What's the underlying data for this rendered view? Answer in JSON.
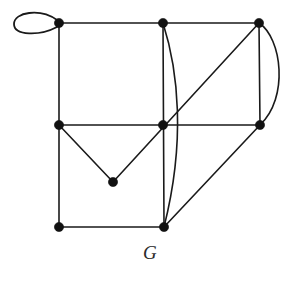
{
  "figure": {
    "label": "G",
    "caption_position": "bottom-center",
    "background_color": "#ffffff",
    "stroke_color": "#1a1a1a",
    "vertex_color": "#111111",
    "width": 300,
    "height": 283
  },
  "graph_data": {
    "type": "diagram",
    "diagram_kind": "undirected-multigraph",
    "title": "G",
    "vertex_count": 9,
    "edge_count": 15,
    "vertices": [
      {
        "id": "v1",
        "name": "top-left-vertex",
        "x": 59,
        "y": 23,
        "radius": 4.6
      },
      {
        "id": "v2",
        "name": "top-middle-vertex",
        "x": 163,
        "y": 23,
        "radius": 4.6
      },
      {
        "id": "v3",
        "name": "top-right-vertex",
        "x": 259,
        "y": 23,
        "radius": 4.6
      },
      {
        "id": "v4",
        "name": "middle-left-vertex",
        "x": 59,
        "y": 125,
        "radius": 4.6
      },
      {
        "id": "v5",
        "name": "center-vertex",
        "x": 163,
        "y": 125,
        "radius": 4.6
      },
      {
        "id": "v6",
        "name": "middle-right-vertex",
        "x": 260,
        "y": 125,
        "radius": 4.6
      },
      {
        "id": "v7",
        "name": "lower-apex-vertex",
        "x": 113,
        "y": 182,
        "radius": 4.6
      },
      {
        "id": "v8",
        "name": "bottom-left-vertex",
        "x": 59,
        "y": 227,
        "radius": 4.6
      },
      {
        "id": "v9",
        "name": "bottom-middle-vertex",
        "x": 164,
        "y": 227,
        "radius": 4.6
      }
    ],
    "edges": [
      {
        "id": "e1",
        "name": "self-loop-top-left",
        "from": "v1",
        "to": "v1",
        "shape": "loop",
        "path": "M 57 20 C 40 8 14 12 14 24 C 14 36 40 36 57 27 Z"
      },
      {
        "id": "e2",
        "name": "edge-top-left-to-top-middle",
        "from": "v1",
        "to": "v2",
        "shape": "line",
        "path": "M 59 23 L 163 23"
      },
      {
        "id": "e3",
        "name": "edge-top-middle-to-top-right",
        "from": "v2",
        "to": "v3",
        "shape": "line",
        "path": "M 163 23 L 259 23"
      },
      {
        "id": "e4",
        "name": "edge-top-left-to-middle-left",
        "from": "v1",
        "to": "v4",
        "shape": "line",
        "path": "M 59 23 L 59 125"
      },
      {
        "id": "e5",
        "name": "edge-top-middle-to-bottom-middle-straight",
        "from": "v2",
        "to": "v9",
        "shape": "line",
        "path": "M 163 23 L 164 227"
      },
      {
        "id": "e6",
        "name": "edge-top-middle-to-bottom-middle-curved",
        "from": "v2",
        "to": "v9",
        "shape": "curve",
        "path": "M 163 23 C 178 70 186 140 164 227"
      },
      {
        "id": "e7",
        "name": "edge-top-right-to-middle-right-straight",
        "from": "v3",
        "to": "v6",
        "shape": "line",
        "path": "M 259 23 L 260 125"
      },
      {
        "id": "e8",
        "name": "edge-top-right-to-middle-right-curved",
        "from": "v3",
        "to": "v6",
        "shape": "curve",
        "path": "M 259 23 C 282 38 289 98 260 125"
      },
      {
        "id": "e9",
        "name": "edge-middle-left-to-center",
        "from": "v4",
        "to": "v5",
        "shape": "line",
        "path": "M 59 125 L 163 125"
      },
      {
        "id": "e10",
        "name": "edge-center-to-middle-right",
        "from": "v5",
        "to": "v6",
        "shape": "line",
        "path": "M 163 125 L 260 125"
      },
      {
        "id": "e11",
        "name": "edge-top-right-to-lower-apex-diagonal",
        "from": "v3",
        "to": "v7",
        "shape": "line",
        "path": "M 259 23 L 113 182"
      },
      {
        "id": "e12",
        "name": "edge-middle-left-to-lower-apex",
        "from": "v4",
        "to": "v7",
        "shape": "line",
        "path": "M 59 125 L 113 182"
      },
      {
        "id": "e13",
        "name": "edge-middle-left-to-bottom-left",
        "from": "v4",
        "to": "v8",
        "shape": "line",
        "path": "M 59 125 L 59 227"
      },
      {
        "id": "e14",
        "name": "edge-bottom-left-to-bottom-middle",
        "from": "v8",
        "to": "v9",
        "shape": "line",
        "path": "M 59 227 L 164 227"
      },
      {
        "id": "e15",
        "name": "edge-bottom-middle-to-middle-right-diagonal",
        "from": "v9",
        "to": "v6",
        "shape": "line",
        "path": "M 164 227 L 260 125"
      }
    ]
  }
}
